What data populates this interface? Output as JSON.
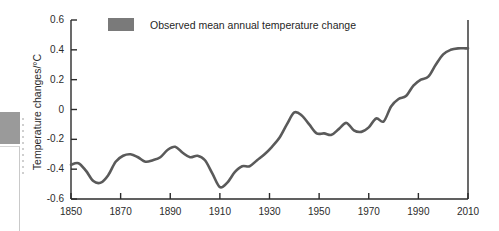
{
  "chart_data": {
    "type": "line",
    "title": "",
    "xlabel": "",
    "ylabel": "Temperature changes/°C",
    "xlim": [
      1850,
      2010
    ],
    "ylim": [
      -0.6,
      0.6
    ],
    "grid": false,
    "legend_position": "top-left",
    "legend": [
      "Observed mean annual temperature change"
    ],
    "xticks": [
      "1850",
      "1870",
      "1890",
      "1910",
      "1930",
      "1950",
      "1970",
      "1990",
      "2010"
    ],
    "xtick_values": [
      1850,
      1870,
      1890,
      1910,
      1930,
      1950,
      1970,
      1990,
      2010
    ],
    "yticks": [
      "0.6",
      "0.4",
      "0.2",
      "0",
      "-0.2",
      "-0.4",
      "-0.6"
    ],
    "ytick_values": [
      0.6,
      0.4,
      0.2,
      0,
      -0.2,
      -0.4,
      -0.6
    ],
    "series": [
      {
        "name": "Observed mean annual temperature change",
        "color": "#5a5a5a",
        "x": [
          1850,
          1853,
          1856,
          1859,
          1862,
          1865,
          1868,
          1871,
          1874,
          1877,
          1880,
          1883,
          1886,
          1889,
          1892,
          1895,
          1898,
          1901,
          1904,
          1907,
          1910,
          1913,
          1916,
          1919,
          1922,
          1925,
          1928,
          1931,
          1934,
          1937,
          1940,
          1943,
          1946,
          1949,
          1952,
          1955,
          1958,
          1961,
          1964,
          1967,
          1970,
          1973,
          1976,
          1979,
          1982,
          1985,
          1988,
          1991,
          1994,
          1997,
          2000,
          2003,
          2006,
          2009,
          2010
        ],
        "y": [
          -0.37,
          -0.36,
          -0.41,
          -0.48,
          -0.49,
          -0.44,
          -0.35,
          -0.31,
          -0.3,
          -0.32,
          -0.35,
          -0.34,
          -0.32,
          -0.27,
          -0.25,
          -0.29,
          -0.32,
          -0.31,
          -0.34,
          -0.43,
          -0.52,
          -0.49,
          -0.42,
          -0.38,
          -0.38,
          -0.34,
          -0.3,
          -0.25,
          -0.19,
          -0.1,
          -0.02,
          -0.04,
          -0.1,
          -0.16,
          -0.16,
          -0.17,
          -0.13,
          -0.09,
          -0.14,
          -0.15,
          -0.12,
          -0.06,
          -0.08,
          0.02,
          0.07,
          0.09,
          0.16,
          0.2,
          0.22,
          0.3,
          0.37,
          0.4,
          0.41,
          0.41,
          0.41
        ]
      }
    ]
  },
  "legend": {
    "label": "Observed mean annual temperature change",
    "swatch_color": "#7a7a7a"
  },
  "axes": {
    "y_title": "Temperature changes/°C"
  }
}
